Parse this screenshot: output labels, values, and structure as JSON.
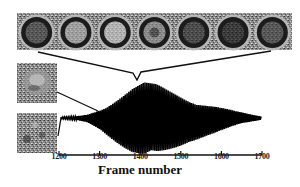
{
  "figure": {
    "top_strip": {
      "frame_count": 7,
      "frames": [
        {
          "center": "dark-speckled",
          "ring": "light"
        },
        {
          "center": "light-gray",
          "ring": "light"
        },
        {
          "center": "bright",
          "ring": "light"
        },
        {
          "center": "medium-dark-spot",
          "ring": "light"
        },
        {
          "center": "dark",
          "ring": "light"
        },
        {
          "center": "black",
          "ring": "light"
        },
        {
          "center": "dark-speckled",
          "ring": "light"
        }
      ]
    },
    "side_thumbnails": [
      {
        "name": "upper-thumbnail",
        "texture": "mottled-blob"
      },
      {
        "name": "lower-thumbnail",
        "texture": "noise"
      }
    ]
  },
  "chart_data": {
    "type": "line",
    "title": "",
    "xlabel": "Frame number",
    "ylabel": "",
    "x_ticks": [
      "1200",
      "1300",
      "1400",
      "1500",
      "1600",
      "1700"
    ],
    "xlim": [
      1200,
      1700
    ],
    "grid": false,
    "legend": null,
    "envelope": {
      "x": [
        1200,
        1240,
        1270,
        1300,
        1340,
        1380,
        1410,
        1440,
        1480,
        1520,
        1560,
        1600,
        1640,
        1680,
        1700
      ],
      "amplitude": [
        0.02,
        0.04,
        0.1,
        0.25,
        0.55,
        0.85,
        1.0,
        0.95,
        0.75,
        0.55,
        0.42,
        0.3,
        0.18,
        0.08,
        0.04
      ]
    }
  },
  "axis": {
    "tick_labels": [
      "1200",
      "1300",
      "1400",
      "1500",
      "1600",
      "1700"
    ],
    "label": "Frame number"
  }
}
